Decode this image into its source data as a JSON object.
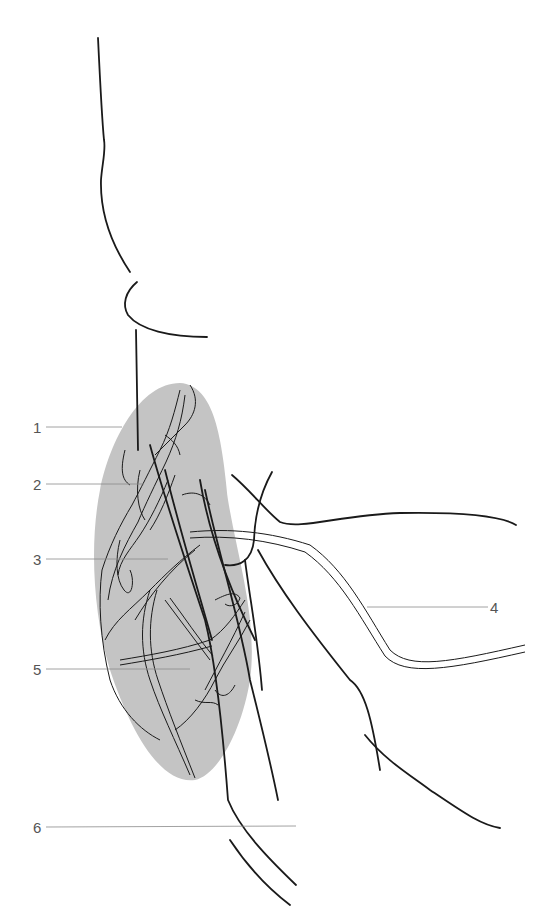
{
  "diagram": {
    "type": "anatomical line drawing",
    "region_fill": "#c4c4c4",
    "line_color": "#1a1a1a",
    "leader_color": "#8a8a8a",
    "labels": [
      {
        "id": "1",
        "text": "1"
      },
      {
        "id": "2",
        "text": "2"
      },
      {
        "id": "3",
        "text": "3"
      },
      {
        "id": "4",
        "text": "4"
      },
      {
        "id": "5",
        "text": "5"
      },
      {
        "id": "6",
        "text": "6"
      }
    ]
  }
}
